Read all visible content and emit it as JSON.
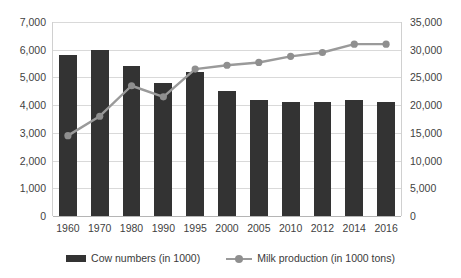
{
  "chart_data": {
    "type": "bar",
    "title": "",
    "xlabel": "",
    "ylabel": "",
    "grid": true,
    "legend_position": "bottom",
    "categories": [
      "1960",
      "1970",
      "1980",
      "1990",
      "1995",
      "2000",
      "2005",
      "2010",
      "2012",
      "2014",
      "2016"
    ],
    "axes": {
      "left": {
        "label": "",
        "ylim": [
          0,
          7000
        ],
        "tick_step": 1000,
        "ticks": [
          "0",
          "1,000",
          "2,000",
          "3,000",
          "4,000",
          "5,000",
          "6,000",
          "7,000"
        ]
      },
      "right": {
        "label": "",
        "ylim": [
          0,
          35000
        ],
        "tick_step": 5000,
        "ticks": [
          "0",
          "5,000",
          "10,000",
          "15,000",
          "20,000",
          "25,000",
          "30,000",
          "35,000"
        ]
      }
    },
    "series": [
      {
        "name": "Cow numbers (in 1000)",
        "type": "bar",
        "axis": "left",
        "color": "#333333",
        "values": [
          5800,
          6000,
          5400,
          4800,
          5200,
          4500,
          4200,
          4100,
          4100,
          4200,
          4100
        ]
      },
      {
        "name": "Milk production (in 1000 tons)",
        "type": "line",
        "axis": "right",
        "color": "#9a9a9a",
        "marker": "circle",
        "values": [
          14500,
          18000,
          23500,
          21500,
          26500,
          27200,
          27700,
          28800,
          29500,
          31000,
          31000
        ]
      }
    ]
  },
  "legend": {
    "items": [
      {
        "label": "Cow numbers (in 1000)",
        "marker": "bar-swatch",
        "color": "#333333"
      },
      {
        "label": "Milk production (in 1000 tons)",
        "marker": "line-marker-swatch",
        "color": "#9a9a9a"
      }
    ]
  }
}
